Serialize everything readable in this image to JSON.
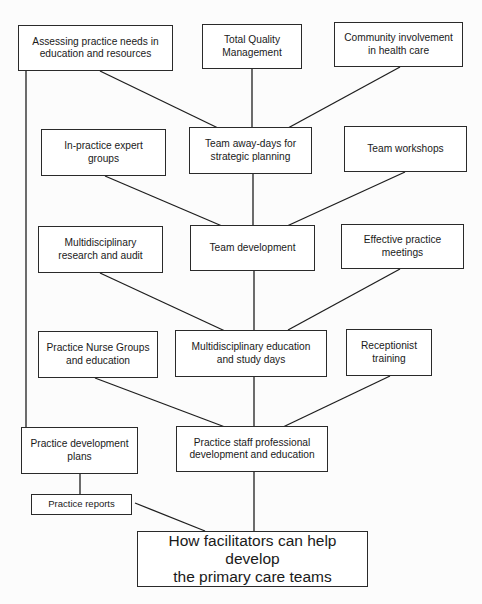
{
  "diagram": {
    "type": "flow-tree",
    "title": "How facilitators can help develop the primary care teams",
    "nodes": {
      "assessing_needs": {
        "label": "Assessing practice needs in\neducation and resources"
      },
      "tqm": {
        "label": "Total Quality\nManagement"
      },
      "community": {
        "label": "Community involvement\nin health care"
      },
      "expert_groups": {
        "label": "In-practice expert\ngroups"
      },
      "away_days": {
        "label": "Team away-days for\nstrategic planning"
      },
      "workshops": {
        "label": "Team workshops"
      },
      "research_audit": {
        "label": "Multidisciplinary\nresearch and audit"
      },
      "team_development": {
        "label": "Team development"
      },
      "practice_meetings": {
        "label": "Effective practice\nmeetings"
      },
      "nurse_groups": {
        "label": "Practice Nurse Groups\nand education"
      },
      "multi_education": {
        "label": "Multidisciplinary education\nand study days"
      },
      "receptionist": {
        "label": "Receptionist\ntraining"
      },
      "dev_plans": {
        "label": "Practice development\nplans"
      },
      "staff_professional": {
        "label": "Practice staff professional\ndevelopment and education"
      },
      "reports": {
        "label": "Practice reports"
      },
      "root": {
        "label": "How facilitators can help develop\nthe primary care teams"
      }
    },
    "edges": [
      [
        "assessing_needs",
        "away_days"
      ],
      [
        "tqm",
        "away_days"
      ],
      [
        "community",
        "away_days"
      ],
      [
        "assessing_needs",
        "dev_plans"
      ],
      [
        "expert_groups",
        "team_development"
      ],
      [
        "away_days",
        "team_development"
      ],
      [
        "workshops",
        "team_development"
      ],
      [
        "research_audit",
        "multi_education"
      ],
      [
        "team_development",
        "multi_education"
      ],
      [
        "practice_meetings",
        "multi_education"
      ],
      [
        "nurse_groups",
        "staff_professional"
      ],
      [
        "multi_education",
        "staff_professional"
      ],
      [
        "receptionist",
        "staff_professional"
      ],
      [
        "dev_plans",
        "reports"
      ],
      [
        "reports",
        "root"
      ],
      [
        "staff_professional",
        "root"
      ]
    ]
  }
}
